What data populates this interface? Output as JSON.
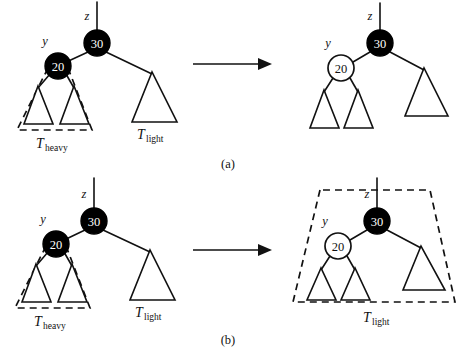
{
  "figure": {
    "caption_a": "(a)",
    "caption_b": "(b)",
    "node_keys": {
      "root": "30",
      "child": "20"
    },
    "pointer_labels": {
      "z": "z",
      "y": "y"
    },
    "subtree_labels": {
      "heavy_main": "T",
      "heavy_sub": "heavy",
      "light_main": "T",
      "light_sub": "light"
    },
    "colors": {
      "black_node": "#000000",
      "white_node": "#ffffff",
      "stroke": "#111111",
      "background": "#ffffff"
    }
  },
  "panel_a": {
    "caption": "(a)",
    "left_tree": {
      "root": {
        "key": "30",
        "fill": "black",
        "pointer": "z"
      },
      "child": {
        "key": "20",
        "fill": "black",
        "pointer": "y"
      },
      "heavy_label_main": "T",
      "heavy_label_sub": "heavy",
      "light_label_main": "T",
      "light_label_sub": "light",
      "dashed_region": "T-heavy"
    },
    "right_tree": {
      "root": {
        "key": "30",
        "fill": "black",
        "pointer": "z"
      },
      "child": {
        "key": "20",
        "fill": "white",
        "pointer": "y"
      },
      "dashed_region": "none"
    },
    "arrow": "right-arrow"
  },
  "panel_b": {
    "caption": "(b)",
    "left_tree": {
      "root": {
        "key": "30",
        "fill": "black",
        "pointer": "z"
      },
      "child": {
        "key": "20",
        "fill": "black",
        "pointer": "y"
      },
      "heavy_label_main": "T",
      "heavy_label_sub": "heavy",
      "light_label_main": "T",
      "light_label_sub": "light",
      "dashed_region": "T-heavy"
    },
    "right_tree": {
      "root": {
        "key": "30",
        "fill": "black",
        "pointer": "z"
      },
      "child": {
        "key": "20",
        "fill": "white",
        "pointer": "y"
      },
      "light_label_main": "T",
      "light_label_sub": "light",
      "dashed_region": "T-light"
    },
    "arrow": "right-arrow"
  }
}
